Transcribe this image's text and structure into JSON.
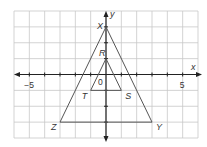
{
  "diagram": {
    "axes": {
      "x_label": "x",
      "y_label": "y",
      "x_range": [
        -6,
        6
      ],
      "y_range": [
        -4,
        4
      ]
    },
    "tick_labels": [
      {
        "text": "−5",
        "value": -5,
        "axis": "x"
      },
      {
        "text": "5",
        "value": 5,
        "axis": "x"
      },
      {
        "text": "0",
        "value": 0,
        "axis": "origin"
      }
    ],
    "triangles": [
      {
        "name": "XYZ",
        "vertices": [
          {
            "label": "X",
            "x": 0,
            "y": 3
          },
          {
            "label": "Y",
            "x": 3,
            "y": -3
          },
          {
            "label": "Z",
            "x": -3,
            "y": -3
          }
        ]
      },
      {
        "name": "RST",
        "vertices": [
          {
            "label": "R",
            "x": 0,
            "y": 1
          },
          {
            "label": "S",
            "x": 1,
            "y": -1
          },
          {
            "label": "T",
            "x": -1,
            "y": -1
          }
        ]
      }
    ]
  }
}
